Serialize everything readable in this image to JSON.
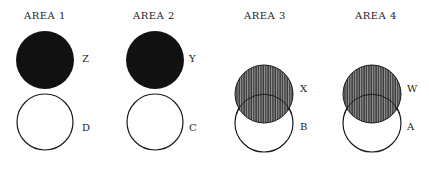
{
  "colors": {
    "ink": "#1a1a1a",
    "filled": "#111111",
    "hatch_bg": "#3a3a3a",
    "hatch_line": "#9a9a9a",
    "background": "#ffffff"
  },
  "areas": [
    {
      "title": "AREA 1",
      "top_circle": {
        "label": "Z",
        "style": "solid-black"
      },
      "bottom_circle": {
        "label": "D",
        "style": "outline"
      },
      "relationship": "separate"
    },
    {
      "title": "AREA 2",
      "top_circle": {
        "label": "Y",
        "style": "solid-black"
      },
      "bottom_circle": {
        "label": "C",
        "style": "outline"
      },
      "relationship": "separate"
    },
    {
      "title": "AREA 3",
      "top_circle": {
        "label": "X",
        "style": "vertical-hatch"
      },
      "bottom_circle": {
        "label": "B",
        "style": "outline"
      },
      "relationship": "overlapping"
    },
    {
      "title": "AREA 4",
      "top_circle": {
        "label": "W",
        "style": "vertical-hatch"
      },
      "bottom_circle": {
        "label": "A",
        "style": "outline"
      },
      "relationship": "overlapping"
    }
  ]
}
